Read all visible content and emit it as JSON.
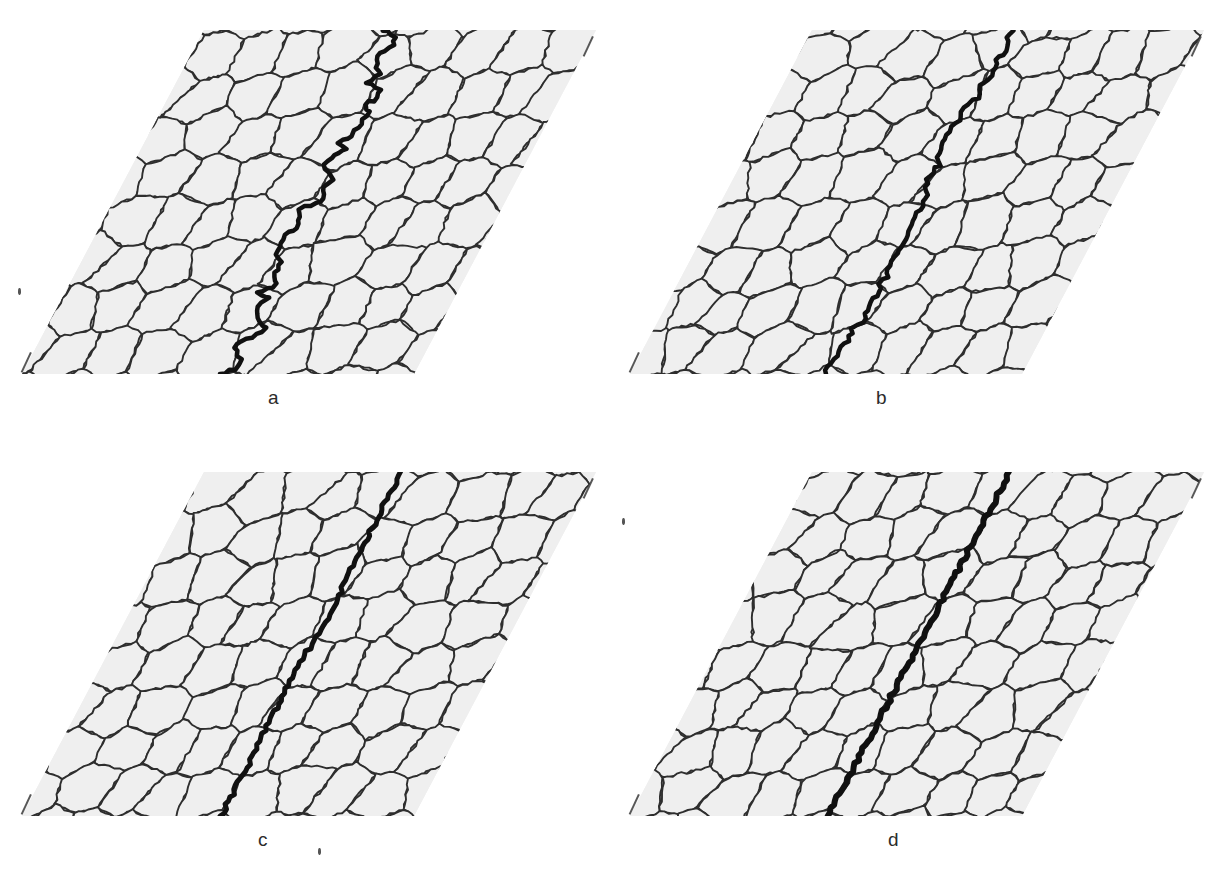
{
  "figure": {
    "background_color": "#ffffff",
    "width": 1225,
    "height": 883,
    "grain_fill_color": "#efefef",
    "grain_boundary_color": "#2e2e2e",
    "crack_color": "#101010",
    "label_color": "#2b2b2b"
  },
  "panels": [
    {
      "id": "a",
      "label": "a",
      "label_x": 268,
      "label_y": 388,
      "origin_x": 22,
      "origin_y": 30,
      "crack_description": "highly tortuous intergranular crack following grain boundaries",
      "crack_tortuosity": 1.0,
      "crack_width": 4.5,
      "crack_amplitude": 26
    },
    {
      "id": "b",
      "label": "b",
      "label_x": 876,
      "label_y": 388,
      "origin_x": 630,
      "origin_y": 30,
      "crack_description": "moderately tortuous mixed intergranular / transgranular crack",
      "crack_tortuosity": 0.62,
      "crack_width": 4.5,
      "crack_amplitude": 16
    },
    {
      "id": "c",
      "label": "c",
      "label_x": 258,
      "label_y": 830,
      "origin_x": 22,
      "origin_y": 472,
      "crack_description": "slightly tortuous crack, mostly transgranular",
      "crack_tortuosity": 0.34,
      "crack_width": 5,
      "crack_amplitude": 9
    },
    {
      "id": "d",
      "label": "d",
      "label_x": 888,
      "label_y": 830,
      "origin_x": 630,
      "origin_y": 472,
      "crack_description": "straight transgranular crack cutting through grains",
      "crack_tortuosity": 0.08,
      "crack_width": 6,
      "crack_amplitude": 3
    }
  ],
  "geometry": {
    "base_width": 392,
    "height": 344,
    "shear_x": 182,
    "grain_columns": 9,
    "grain_rows": 8,
    "grain_count_approx": 78
  },
  "chart_data": {
    "type": "diagram",
    "categories": [
      "a",
      "b",
      "c",
      "d"
    ],
    "series": [
      {
        "name": "Crack tortuosity (relative)",
        "values": [
          1.0,
          0.62,
          0.34,
          0.08
        ]
      },
      {
        "name": "Crack line width (px)",
        "values": [
          4.5,
          4.5,
          5.0,
          6.0
        ]
      },
      {
        "name": "Lateral deviation amplitude (px)",
        "values": [
          26,
          16,
          9,
          3
        ]
      }
    ],
    "xlabel": "Panel",
    "ylabel": "Tortuosity"
  },
  "artifacts": [
    {
      "name": "corner-tick-top-right-a",
      "x": 592,
      "y": 36,
      "type": "tick"
    },
    {
      "name": "corner-tick-bottom-left-a",
      "x": 30,
      "y": 352,
      "type": "tick"
    },
    {
      "name": "corner-tick-top-right-b",
      "x": 1200,
      "y": 36,
      "type": "tick"
    },
    {
      "name": "corner-tick-bottom-left-b",
      "x": 638,
      "y": 352,
      "type": "tick"
    },
    {
      "name": "corner-tick-top-right-c",
      "x": 592,
      "y": 478,
      "type": "tick"
    },
    {
      "name": "corner-tick-bottom-left-c",
      "x": 30,
      "y": 794,
      "type": "tick"
    },
    {
      "name": "corner-tick-top-right-d",
      "x": 1200,
      "y": 478,
      "type": "tick"
    },
    {
      "name": "corner-tick-bottom-left-d",
      "x": 638,
      "y": 794,
      "type": "tick"
    },
    {
      "name": "scan-speck-below-c",
      "x": 318,
      "y": 848,
      "type": "speck"
    },
    {
      "name": "scan-speck-left-a",
      "x": 18,
      "y": 288,
      "type": "speck"
    },
    {
      "name": "scan-speck-left-d",
      "x": 622,
      "y": 518,
      "type": "speck"
    }
  ]
}
